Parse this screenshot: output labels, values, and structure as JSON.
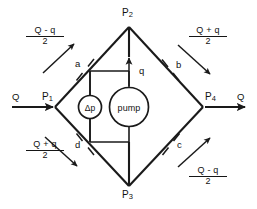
{
  "diagram": {
    "nodes": [
      {
        "id": "P1",
        "label": "P",
        "sub": "1",
        "x": 55,
        "y": 107
      },
      {
        "id": "P2",
        "label": "P",
        "sub": "2",
        "x": 129,
        "y": 27
      },
      {
        "id": "P3",
        "label": "P",
        "sub": "3",
        "x": 129,
        "y": 186
      },
      {
        "id": "P4",
        "label": "P",
        "sub": "4",
        "x": 203,
        "y": 107
      }
    ],
    "branches": [
      {
        "id": "a",
        "label": "a",
        "position": "upper-left"
      },
      {
        "id": "b",
        "label": "b",
        "position": "upper-right"
      },
      {
        "id": "c",
        "label": "c",
        "position": "lower-right"
      },
      {
        "id": "d",
        "label": "d",
        "position": "lower-left"
      }
    ],
    "inlet": {
      "label": "Q",
      "direction": "right"
    },
    "outlet": {
      "label": "Q",
      "direction": "right"
    },
    "pump_flow": {
      "label": "q",
      "direction": "up"
    },
    "devices": [
      {
        "id": "dp",
        "label": "Δp"
      },
      {
        "id": "pump",
        "label": "pump"
      }
    ],
    "flow_rates": [
      {
        "id": "flow-upper-left",
        "numerator": "Q - q",
        "denominator": "2",
        "arrow": "up-right",
        "branch": "a"
      },
      {
        "id": "flow-upper-right",
        "numerator": "Q + q",
        "denominator": "2",
        "arrow": "down-right",
        "branch": "b"
      },
      {
        "id": "flow-lower-left",
        "numerator": "Q + q",
        "denominator": "2",
        "arrow": "down-right",
        "branch": "d"
      },
      {
        "id": "flow-lower-right",
        "numerator": "Q - q",
        "denominator": "2",
        "arrow": "up-right",
        "branch": "c"
      }
    ],
    "colors": {
      "line": "#1a1a1a",
      "text": "#111111",
      "background": "#ffffff"
    }
  }
}
